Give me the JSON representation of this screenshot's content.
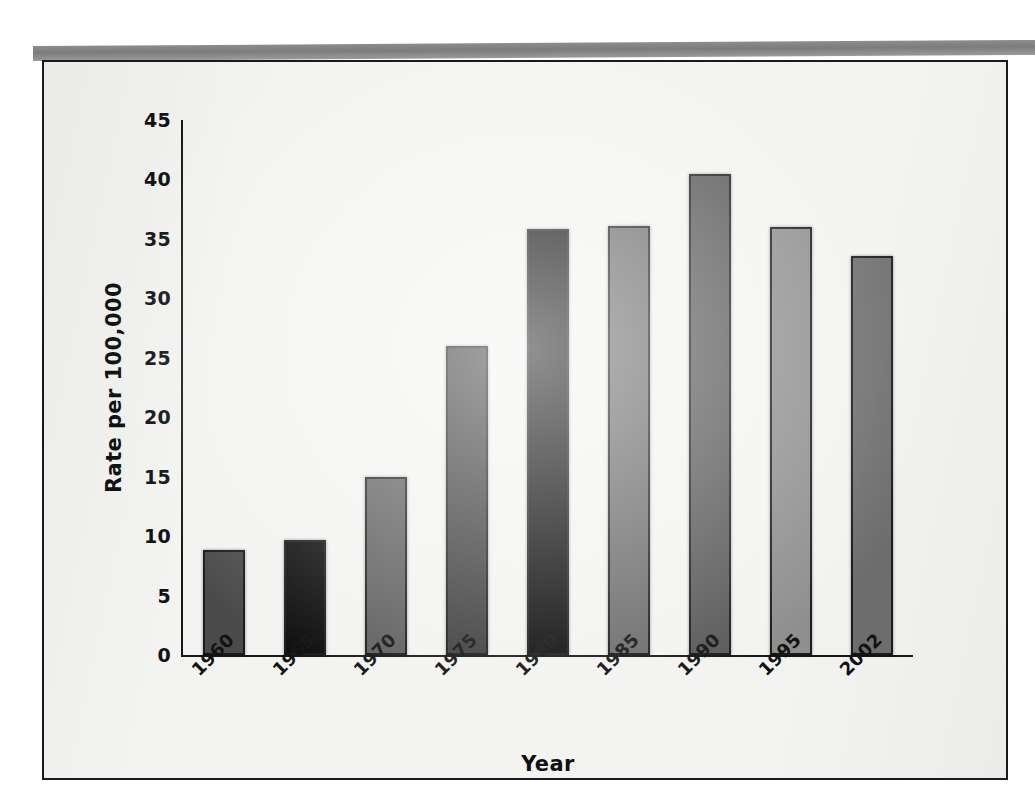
{
  "figure": {
    "frame_border_color": "#1a1a1a",
    "paper_color": "#f3f3f1",
    "top_band_color": "#8d8d8d"
  },
  "chart_data": {
    "type": "bar",
    "title": "",
    "xlabel": "Year",
    "ylabel": "Rate per 100,000",
    "categories": [
      "1960",
      "1965",
      "1970",
      "1975",
      "1980",
      "1985",
      "1990",
      "1995",
      "2002"
    ],
    "values": [
      8.8,
      9.7,
      15.0,
      26.0,
      35.8,
      36.1,
      40.5,
      36.0,
      33.6
    ],
    "ylim": [
      0,
      45
    ],
    "yticks": [
      0,
      5,
      10,
      15,
      20,
      25,
      30,
      35,
      40,
      45
    ],
    "ytick_labels": [
      "0",
      "5",
      "10",
      "15",
      "20",
      "25",
      "30",
      "35",
      "40",
      "45"
    ],
    "grid": false,
    "legend": null,
    "bar_colors": [
      "#4a4a4a",
      "#0d0d0d",
      "#5e5e5e",
      "#3d3d3d",
      "#0d0d0d",
      "#6b6b6b",
      "#585858",
      "#8e8e8e",
      "#6e6e6e"
    ]
  }
}
